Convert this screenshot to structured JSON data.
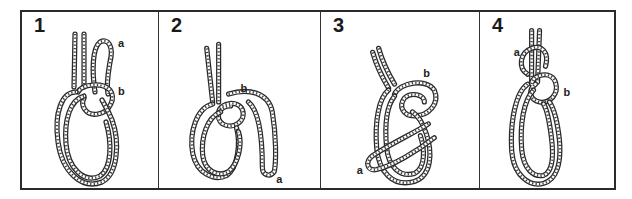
{
  "figure": {
    "type": "knot-tying step diagram",
    "border_color": "#2b2b2b",
    "rope_color": "#2a2a2a",
    "background": "#ffffff"
  },
  "steps": [
    {
      "number": "1",
      "labels": {
        "a": "a",
        "b": "b"
      }
    },
    {
      "number": "2",
      "labels": {
        "a": "a",
        "b": "b"
      }
    },
    {
      "number": "3",
      "labels": {
        "a": "a",
        "b": "b"
      }
    },
    {
      "number": "4",
      "labels": {
        "a": "a",
        "b": "b"
      }
    }
  ]
}
